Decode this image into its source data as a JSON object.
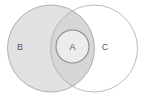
{
  "diagram": {
    "type": "venn-euler-diagram",
    "background_color": "#ffffff",
    "sets": [
      {
        "id": "B",
        "label": "B",
        "role": "outer-left-set",
        "shape": "circle",
        "cx": 51,
        "cy": 48.5,
        "r": 43.5,
        "fill": "#e2e2e2",
        "stroke": "#a8a8a8",
        "stroke_width": 0.9,
        "label_x": 20,
        "label_y": 48
      },
      {
        "id": "C",
        "label": "C",
        "role": "outer-right-set",
        "shape": "circle",
        "cx": 94,
        "cy": 48.5,
        "r": 43.5,
        "fill": "none",
        "stroke": "#b4b4b4",
        "stroke_width": 0.9,
        "label_x": 105,
        "label_y": 48
      },
      {
        "id": "A",
        "label": "A",
        "role": "inner-intersection-set",
        "shape": "circle",
        "cx": 72.5,
        "cy": 46.5,
        "r": 16.5,
        "fill": "#ececec",
        "stroke": "#8c8c8c",
        "stroke_width": 1.1,
        "label_x": 72.5,
        "label_y": 48
      }
    ],
    "regions": [
      {
        "name": "B-only",
        "description": "inside B, outside C",
        "fill": "#e2e2e2"
      },
      {
        "name": "B-intersect-C",
        "description": "lens overlap of B and C",
        "fill": "#d6d6d6"
      },
      {
        "name": "C-only",
        "description": "inside C, outside B",
        "fill": "#ffffff"
      },
      {
        "name": "A",
        "description": "small circle A nested within B-intersect-C",
        "fill": "#ececec"
      }
    ],
    "label_color": "#58585a",
    "label_font_size_px": 9
  }
}
